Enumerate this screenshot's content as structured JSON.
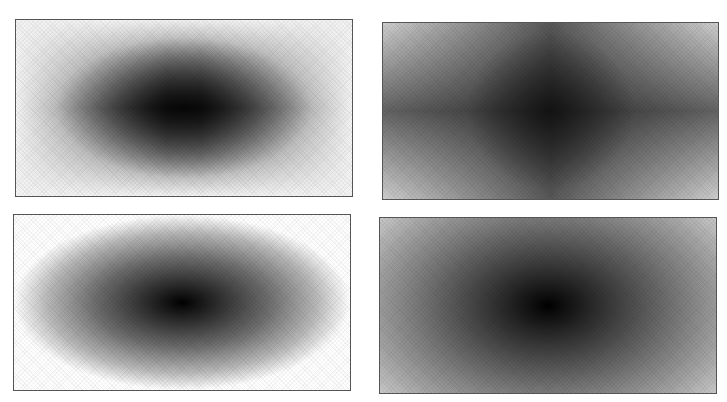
{
  "figure": {
    "background": "#ffffff",
    "frame_color": "#555555",
    "panels": [
      {
        "id": "rectangular-gradient",
        "shape": "rectangular",
        "position": {
          "left": 15,
          "top": 19,
          "width": 338,
          "height": 178
        },
        "center_color": "#000000",
        "edge_color": "#f4f4f4"
      },
      {
        "id": "cross-gradient",
        "shape": "cross",
        "position": {
          "left": 382,
          "top": 22,
          "width": 337,
          "height": 178
        },
        "center_color": "#000000",
        "edge_color": "#e6e6e6"
      },
      {
        "id": "elliptical-gradient",
        "shape": "ellipse",
        "position": {
          "left": 13,
          "top": 214,
          "width": 338,
          "height": 177
        },
        "center_color": "#000000",
        "edge_color": "#ffffff"
      },
      {
        "id": "radial-gradient",
        "shape": "radial",
        "position": {
          "left": 379,
          "top": 217,
          "width": 338,
          "height": 177
        },
        "center_color": "#000000",
        "edge_color": "#f0f0f0"
      }
    ]
  }
}
